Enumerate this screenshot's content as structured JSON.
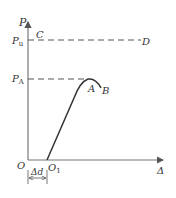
{
  "diagram": {
    "type": "load-displacement curve",
    "axes": {
      "y_label": "P",
      "x_label": "Δ",
      "origin_label": "O"
    },
    "levels": {
      "Pu": {
        "label_main": "P",
        "label_sub": "u"
      },
      "PA": {
        "label_main": "P",
        "label_sub": "A"
      }
    },
    "points": {
      "C": "C",
      "D": "D",
      "A": "A",
      "B": "B",
      "O1": {
        "label_main": "O",
        "label_sub": "1"
      }
    },
    "offset_dimension": "Δd",
    "colors": {
      "axis": "#777777",
      "curve": "#333333",
      "dash": "#555555",
      "text": "#333333"
    }
  }
}
